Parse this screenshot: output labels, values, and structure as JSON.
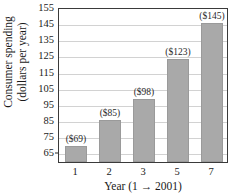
{
  "chart_data": {
    "type": "bar",
    "title": "",
    "subtitle": "",
    "xlabel": "Year (1 → 2001)",
    "ylabel_line1": "Consumer spending",
    "ylabel_line2": "(dollars per year)",
    "ylabel": "Consumer spending (dollars per year)",
    "categories": [
      "1",
      "2",
      "3",
      "5",
      "7"
    ],
    "values": [
      69,
      85,
      98,
      123,
      145
    ],
    "data_labels": [
      "($69)",
      "($85)",
      "($98)",
      "($123)",
      "($145)"
    ],
    "ylim": [
      59,
      155
    ],
    "yticks": [
      65,
      75,
      85,
      95,
      105,
      115,
      125,
      135,
      145,
      155
    ],
    "ytick_labels": [
      "65",
      "75",
      "85",
      "95",
      "105",
      "115",
      "125",
      "135",
      "145",
      "155"
    ],
    "grid": true,
    "grid_axis": "y",
    "legend": false,
    "legend_position": "none",
    "bar_color": "#a9a9a9",
    "gridline_color": "#d2d2d2",
    "axis_color": "#3a3a3a",
    "text_color": "#1a1a1a",
    "background_color": "#ffffff"
  }
}
